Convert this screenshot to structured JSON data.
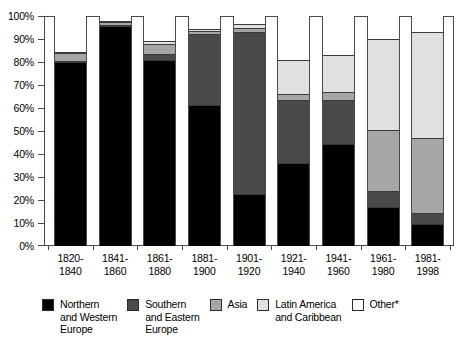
{
  "chart_data": {
    "type": "bar",
    "title": "",
    "subtitle": "",
    "xlabel": "",
    "ylabel": "",
    "ylim": [
      0,
      100
    ],
    "stacked": true,
    "percent_axis": true,
    "grid": false,
    "legend_position": "bottom",
    "categories": [
      "1820-\n1840",
      "1841-\n1860",
      "1861-\n1880",
      "1881-\n1900",
      "1901-\n1920",
      "1921-\n1940",
      "1941-\n1960",
      "1961-\n1980",
      "1981-\n1998"
    ],
    "ytick_labels": [
      "100%",
      "90%",
      "80%",
      "70%",
      "60%",
      "50%",
      "40%",
      "30%",
      "20%",
      "10%",
      "0%"
    ],
    "ytick_values": [
      100,
      90,
      80,
      70,
      60,
      50,
      40,
      30,
      20,
      10,
      0
    ],
    "series": [
      {
        "name": "Northern and Western Europe",
        "color": "#000000",
        "values": [
          80,
          95.5,
          81,
          61.5,
          22.5,
          36,
          44.5,
          17,
          9.5
        ]
      },
      {
        "name": "Southern and Eastern Europe",
        "color": "#4a4a4a",
        "values": [
          0.5,
          0.5,
          2.5,
          30.5,
          70.5,
          27.5,
          19,
          7,
          5
        ]
      },
      {
        "name": "Asia",
        "color": "#a6a6a6",
        "values": [
          3.5,
          1.5,
          4.5,
          1.5,
          2,
          2.5,
          3.5,
          26.5,
          32.5
        ]
      },
      {
        "name": "Latin America and Caribbean",
        "color": "#e0e0e0",
        "values": [
          0.5,
          0.5,
          1,
          1,
          1.5,
          15,
          16,
          39.5,
          46
        ]
      },
      {
        "name": "Other*",
        "color": "#ffffff",
        "values": [
          15.5,
          2,
          11,
          5.5,
          3.5,
          19,
          17,
          10,
          7
        ]
      }
    ],
    "legend": [
      {
        "label": "Northern\nand Western\nEurope",
        "color": "#000000"
      },
      {
        "label": "Southern\nand Eastern\nEurope",
        "color": "#4a4a4a"
      },
      {
        "label": "Asia",
        "color": "#a6a6a6"
      },
      {
        "label": "Latin America\nand Caribbean",
        "color": "#e0e0e0"
      },
      {
        "label": "Other*",
        "color": "#ffffff"
      }
    ]
  }
}
